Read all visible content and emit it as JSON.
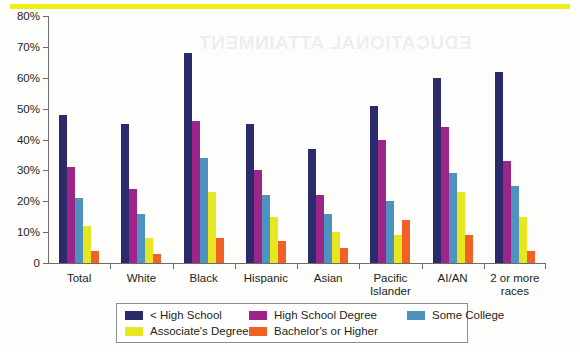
{
  "decor": {
    "bleed_text": "EDUCATIONAL ATTAINMENT",
    "rule_color": "#eded18"
  },
  "chart_data": {
    "type": "bar",
    "title": "",
    "subtitle": "",
    "xlabel": "",
    "ylabel": "",
    "ylim": [
      0,
      80
    ],
    "grid": false,
    "legend_position": "bottom",
    "ytick_labels": [
      "0",
      "10%",
      "20%",
      "30%",
      "40%",
      "50%",
      "60%",
      "70%",
      "80%"
    ],
    "ytick_values": [
      0,
      10,
      20,
      30,
      40,
      50,
      60,
      70,
      80
    ],
    "categories": [
      "Total",
      "White",
      "Black",
      "Hispanic",
      "Asian",
      "Pacific Islander",
      "AI/AN",
      "2 or more races"
    ],
    "series": [
      {
        "name": "< High School",
        "color": "#2b2a6b",
        "values": [
          48,
          45,
          68,
          45,
          37,
          51,
          60,
          62
        ]
      },
      {
        "name": "High School Degree",
        "color": "#9c2589",
        "values": [
          31,
          24,
          46,
          30,
          22,
          40,
          44,
          33
        ]
      },
      {
        "name": "Some College",
        "color": "#4e93c0",
        "values": [
          21,
          16,
          34,
          22,
          16,
          20,
          29,
          25
        ]
      },
      {
        "name": "Associate's Degree",
        "color": "#e6e621",
        "values": [
          12,
          8,
          23,
          15,
          10,
          9,
          23,
          15
        ]
      },
      {
        "name": "Bachelor's or Higher",
        "color": "#f06124",
        "values": [
          4,
          3,
          8,
          7,
          5,
          14,
          9,
          4
        ]
      }
    ]
  },
  "legend": {
    "items": [
      {
        "label": "< High School",
        "color": "#2b2a6b"
      },
      {
        "label": "High School Degree",
        "color": "#9c2589"
      },
      {
        "label": "Some College",
        "color": "#4e93c0"
      },
      {
        "label": "Associate's Degree",
        "color": "#e6e621"
      },
      {
        "label": "Bachelor's or Higher",
        "color": "#f06124"
      }
    ]
  }
}
